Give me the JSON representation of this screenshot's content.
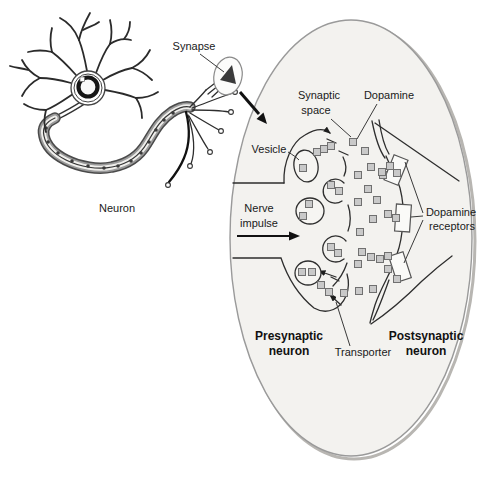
{
  "labels": {
    "neuron": "Neuron",
    "synapse": "Synapse",
    "synaptic": "Synaptic",
    "space": "space",
    "dopamine": "Dopamine",
    "vesicle": "Vesicle",
    "nerve": "Nerve",
    "impulse": "impulse",
    "dopamine_receptors_1": "Dopamine",
    "dopamine_receptors_2": "receptors",
    "presynaptic_1": "Presynaptic",
    "presynaptic_2": "neuron",
    "postsynaptic_1": "Postsynaptic",
    "postsynaptic_2": "neuron",
    "transporter": "Transporter"
  },
  "colors": {
    "background": "#ffffff",
    "ellipse_fill": "#f3f2ef",
    "ellipse_stroke": "#9a9a9a",
    "ellipse_shadow": "#b8b6b2",
    "line": "#2e2e2e",
    "molecule_fill": "#c9c9c9",
    "molecule_stroke": "#707070",
    "vesicle_fill": "#f6f5f2",
    "receptor_fill": "#fafaf8",
    "receptor_stroke": "#555555",
    "text": "#1a1a1a"
  },
  "diagram": {
    "molecule_size": 7,
    "molecules": [
      [
        303,
        168
      ],
      [
        331,
        185
      ],
      [
        339,
        191
      ],
      [
        309,
        204
      ],
      [
        303,
        216
      ],
      [
        331,
        247
      ],
      [
        338,
        253
      ],
      [
        302,
        272
      ],
      [
        312,
        272
      ],
      [
        317,
        152
      ],
      [
        324,
        149
      ],
      [
        331,
        146
      ],
      [
        353,
        142
      ],
      [
        365,
        151
      ],
      [
        358,
        175
      ],
      [
        371,
        167
      ],
      [
        383,
        175
      ],
      [
        390,
        166
      ],
      [
        397,
        173
      ],
      [
        382,
        172
      ],
      [
        368,
        189
      ],
      [
        358,
        202
      ],
      [
        377,
        200
      ],
      [
        388,
        214
      ],
      [
        396,
        218
      ],
      [
        373,
        219
      ],
      [
        360,
        232
      ],
      [
        362,
        252
      ],
      [
        371,
        257
      ],
      [
        380,
        259
      ],
      [
        388,
        256
      ],
      [
        358,
        264
      ],
      [
        388,
        269
      ],
      [
        397,
        279
      ],
      [
        373,
        289
      ],
      [
        359,
        291
      ],
      [
        321,
        285
      ],
      [
        329,
        292
      ],
      [
        344,
        293
      ]
    ],
    "vesicles": [
      {
        "cx": 306,
        "cy": 166,
        "rx": 12,
        "ry": 16,
        "rot": -10
      },
      {
        "cx": 310,
        "cy": 211,
        "rx": 14,
        "ry": 13,
        "rot": 0
      },
      {
        "cx": 308,
        "cy": 273,
        "rx": 13,
        "ry": 12,
        "rot": 0
      }
    ],
    "receptors": [
      {
        "cx": 396,
        "cy": 170,
        "w": 15,
        "h": 27,
        "rot": 22
      },
      {
        "cx": 403,
        "cy": 218,
        "w": 15,
        "h": 27,
        "rot": 4
      },
      {
        "cx": 400,
        "cy": 267,
        "w": 15,
        "h": 27,
        "rot": -18
      }
    ]
  }
}
